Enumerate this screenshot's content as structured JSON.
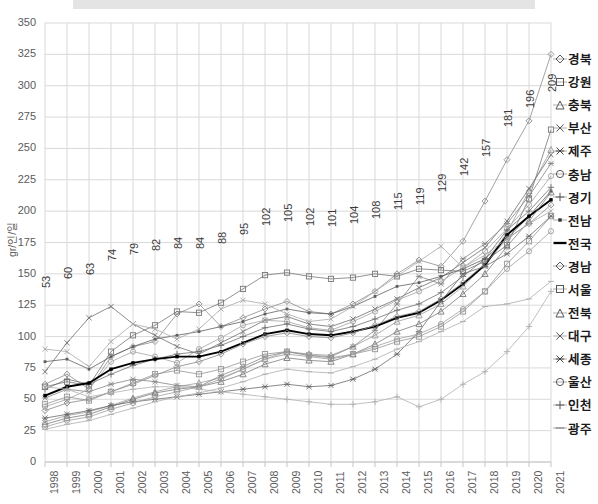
{
  "chart_data": {
    "type": "line",
    "title": "",
    "xlabel": "",
    "ylabel": "gr/인/일",
    "ylim": [
      0,
      350
    ],
    "ytick_step": 25,
    "yticks": [
      0,
      25,
      50,
      75,
      100,
      125,
      150,
      175,
      200,
      225,
      250,
      275,
      300,
      325,
      350
    ],
    "grid": true,
    "legend_position": "right",
    "x": [
      "1998",
      "1999",
      "2000",
      "2001",
      "2002",
      "2003",
      "2004",
      "2005",
      "2006",
      "2007",
      "2008",
      "2009",
      "2010",
      "2011",
      "2012",
      "2013",
      "2014",
      "2015",
      "2016",
      "2017",
      "2018",
      "2019",
      "2020",
      "2021"
    ],
    "data_labels": {
      "series": "전국",
      "values": [
        53,
        60,
        63,
        74,
        79,
        82,
        84,
        84,
        88,
        95,
        102,
        105,
        102,
        101,
        104,
        108,
        115,
        119,
        129,
        142,
        157,
        181,
        196,
        209
      ]
    },
    "series": [
      {
        "name": "경북",
        "marker": "diamond",
        "emphasis": false,
        "values": [
          62,
          70,
          58,
          84,
          92,
          96,
          118,
          126,
          108,
          115,
          122,
          128,
          120,
          118,
          126,
          136,
          150,
          161,
          156,
          176,
          208,
          241,
          272,
          325
        ]
      },
      {
        "name": "강원",
        "marker": "square",
        "emphasis": false,
        "values": [
          60,
          64,
          61,
          88,
          101,
          109,
          120,
          119,
          127,
          138,
          149,
          151,
          148,
          146,
          147,
          150,
          148,
          154,
          153,
          152,
          160,
          173,
          210,
          265
        ]
      },
      {
        "name": "충북",
        "marker": "triangle",
        "emphasis": false,
        "values": [
          32,
          37,
          40,
          45,
          51,
          56,
          60,
          63,
          67,
          74,
          82,
          88,
          86,
          85,
          92,
          101,
          112,
          117,
          126,
          140,
          157,
          183,
          216,
          249
        ]
      },
      {
        "name": "부산",
        "marker": "cross-x",
        "emphasis": false,
        "values": [
          72,
          95,
          115,
          124,
          110,
          101,
          92,
          86,
          95,
          104,
          113,
          116,
          110,
          108,
          114,
          122,
          130,
          139,
          147,
          159,
          171,
          192,
          218,
          245
        ]
      },
      {
        "name": "제주",
        "marker": "asterisk",
        "emphasis": false,
        "values": [
          51,
          58,
          56,
          62,
          66,
          64,
          61,
          60,
          69,
          76,
          84,
          88,
          85,
          84,
          92,
          105,
          126,
          148,
          142,
          162,
          174,
          190,
          212,
          238
        ]
      },
      {
        "name": "충남",
        "marker": "circle",
        "emphasis": false,
        "values": [
          44,
          50,
          58,
          80,
          88,
          84,
          79,
          90,
          99,
          109,
          113,
          112,
          107,
          105,
          112,
          120,
          129,
          136,
          144,
          155,
          168,
          186,
          205,
          228
        ]
      },
      {
        "name": "경기",
        "marker": "plus",
        "emphasis": false,
        "values": [
          58,
          66,
          62,
          70,
          77,
          82,
          86,
          88,
          93,
          100,
          107,
          110,
          106,
          104,
          108,
          114,
          121,
          126,
          135,
          148,
          162,
          185,
          200,
          219
        ]
      },
      {
        "name": "전남",
        "marker": "dot-dash",
        "emphasis": false,
        "values": [
          80,
          82,
          74,
          84,
          92,
          98,
          101,
          104,
          108,
          112,
          118,
          122,
          119,
          118,
          124,
          132,
          140,
          143,
          148,
          154,
          162,
          178,
          196,
          216
        ]
      },
      {
        "name": "전국",
        "marker": "thick-line",
        "emphasis": true,
        "values": [
          53,
          60,
          63,
          74,
          79,
          82,
          84,
          84,
          88,
          95,
          102,
          105,
          102,
          101,
          104,
          108,
          115,
          119,
          129,
          142,
          157,
          181,
          196,
          209
        ]
      },
      {
        "name": "경남",
        "marker": "diamond",
        "emphasis": false,
        "values": [
          41,
          47,
          50,
          56,
          62,
          69,
          76,
          80,
          86,
          94,
          100,
          103,
          100,
          99,
          103,
          109,
          116,
          120,
          130,
          143,
          158,
          178,
          190,
          205
        ]
      },
      {
        "name": "서울",
        "marker": "square",
        "emphasis": false,
        "values": [
          46,
          52,
          49,
          56,
          63,
          70,
          73,
          70,
          74,
          80,
          86,
          88,
          85,
          83,
          86,
          90,
          96,
          100,
          108,
          120,
          136,
          158,
          176,
          196
        ]
      },
      {
        "name": "전북",
        "marker": "triangle",
        "emphasis": false,
        "values": [
          30,
          35,
          38,
          44,
          50,
          55,
          58,
          60,
          64,
          70,
          78,
          83,
          81,
          80,
          86,
          94,
          104,
          110,
          120,
          134,
          150,
          172,
          192,
          215
        ]
      },
      {
        "name": "대구",
        "marker": "cross-x",
        "emphasis": false,
        "values": [
          90,
          88,
          76,
          96,
          110,
          106,
          98,
          106,
          122,
          129,
          126,
          118,
          112,
          114,
          124,
          136,
          148,
          160,
          172,
          155,
          165,
          178,
          190,
          200
        ]
      },
      {
        "name": "세종",
        "marker": "asterisk",
        "emphasis": false,
        "values": [
          35,
          38,
          41,
          45,
          48,
          50,
          52,
          54,
          56,
          58,
          60,
          62,
          60,
          61,
          66,
          74,
          86,
          104,
          128,
          150,
          156,
          166,
          180,
          196
        ]
      },
      {
        "name": "울산",
        "marker": "circle",
        "emphasis": false,
        "values": [
          28,
          33,
          36,
          42,
          47,
          52,
          56,
          60,
          66,
          74,
          82,
          86,
          84,
          82,
          86,
          92,
          98,
          102,
          110,
          122,
          136,
          154,
          168,
          184
        ]
      },
      {
        "name": "인천",
        "marker": "plus",
        "emphasis": false,
        "values": [
          60,
          58,
          52,
          55,
          58,
          60,
          60,
          58,
          56,
          54,
          52,
          50,
          48,
          46,
          46,
          48,
          52,
          44,
          50,
          62,
          72,
          88,
          108,
          136
        ]
      },
      {
        "name": "광주",
        "marker": "dash",
        "emphasis": false,
        "values": [
          26,
          30,
          33,
          38,
          43,
          48,
          52,
          55,
          59,
          64,
          70,
          74,
          72,
          71,
          76,
          82,
          90,
          96,
          104,
          112,
          124,
          126,
          130,
          144
        ]
      }
    ]
  },
  "legend": {
    "items": [
      {
        "label": "경북",
        "marker": "diamond-icon"
      },
      {
        "label": "강원",
        "marker": "square-icon"
      },
      {
        "label": "충북",
        "marker": "triangle-icon"
      },
      {
        "label": "부산",
        "marker": "cross-x-icon"
      },
      {
        "label": "제주",
        "marker": "asterisk-icon"
      },
      {
        "label": "충남",
        "marker": "circle-icon"
      },
      {
        "label": "경기",
        "marker": "plus-icon"
      },
      {
        "label": "전남",
        "marker": "dot-dash-icon"
      },
      {
        "label": "전국",
        "marker": "thick-line-icon"
      },
      {
        "label": "경남",
        "marker": "diamond-icon"
      },
      {
        "label": "서울",
        "marker": "square-icon"
      },
      {
        "label": "전북",
        "marker": "triangle-icon"
      },
      {
        "label": "대구",
        "marker": "cross-x-icon"
      },
      {
        "label": "세종",
        "marker": "asterisk-icon"
      },
      {
        "label": "울산",
        "marker": "circle-icon"
      },
      {
        "label": "인천",
        "marker": "plus-icon"
      },
      {
        "label": "광주",
        "marker": "dash-icon"
      }
    ]
  },
  "colors": {
    "grid": "#d9d9d9",
    "axis_text": "#5b5b5b",
    "data_label_text": "#3a3a3a",
    "emphasis_line": "#000000",
    "top_bar": "#e4e4e4"
  }
}
